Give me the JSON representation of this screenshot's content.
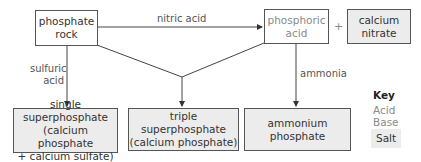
{
  "diagram": {
    "nodes": {
      "phosphate_rock": {
        "label": "phosphate\nrock",
        "type": "base"
      },
      "phosphoric_acid": {
        "label": "phosphoric\nacid",
        "type": "acid"
      },
      "calcium_nitrate": {
        "label": "calcium\nnitrate",
        "type": "salt"
      },
      "single_superphosphate": {
        "label": "single superphosphate\n(calcium phosphate\n+ calcium sulfate)",
        "type": "salt"
      },
      "triple_superphosphate": {
        "label": "triple superphosphate\n(calcium phosphate)",
        "type": "salt"
      },
      "ammonium_phosphate": {
        "label": "ammonium\nphosphate",
        "type": "salt"
      }
    },
    "edges": {
      "nitric_acid": "nitric acid",
      "sulfuric_acid": "sulfuric\nacid",
      "ammonia": "ammonia"
    },
    "plus": "+",
    "key": {
      "title": "Key",
      "acid": "Acid",
      "base": "Base",
      "salt": "Salt"
    },
    "colors": {
      "line": "#444444",
      "salt_fill": "#ececec",
      "acid_text": "#8a8a8a",
      "base_text": "#333333"
    }
  }
}
